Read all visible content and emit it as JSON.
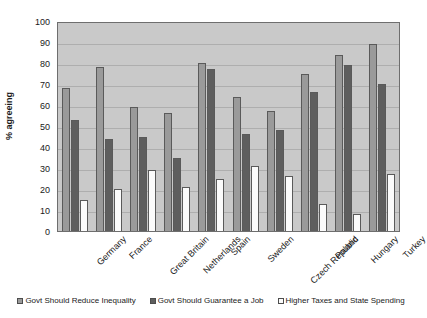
{
  "chart_data": {
    "type": "bar",
    "title": "",
    "xlabel": "",
    "ylabel": "% agreeing",
    "ylim": [
      0,
      100
    ],
    "ytick_step": 10,
    "yticks": [
      0,
      10,
      20,
      30,
      40,
      50,
      60,
      70,
      80,
      90,
      100
    ],
    "grid": true,
    "legend_position": "bottom",
    "categories": [
      "Germany",
      "France",
      "Great Britain",
      "Netherlands",
      "Spain",
      "Sweden",
      "Czech Republic",
      "Poland",
      "Hungary",
      "Turkey"
    ],
    "series": [
      {
        "name": "Govt Should Reduce Inequality",
        "color": "#9a9a9a",
        "values": [
          68,
          78,
          59,
          56,
          80,
          64,
          57,
          75,
          84,
          89
        ]
      },
      {
        "name": "Govt Should Guarantee a Job",
        "color": "#5e5e5e",
        "values": [
          53,
          44,
          45,
          35,
          77,
          46,
          48,
          66,
          79,
          70
        ]
      },
      {
        "name": "Higher Taxes and State Spending",
        "color": "#fbfbfb",
        "values": [
          15,
          20,
          29,
          21,
          25,
          31,
          26,
          13,
          8,
          27
        ]
      }
    ]
  },
  "plot": {
    "background_color": "#c9c9c9",
    "border_color": "#6e6e6e",
    "gridline_color": "#aeaeae"
  }
}
